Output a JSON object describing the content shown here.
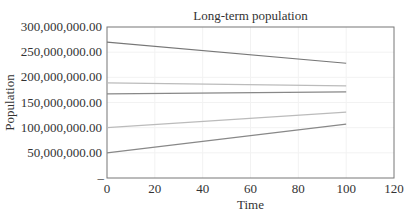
{
  "chart_data": {
    "type": "line",
    "title": "Long-term population",
    "xlabel": "Time",
    "ylabel": "Population",
    "xlim": [
      0,
      120
    ],
    "ylim": [
      0,
      300000000
    ],
    "x_ticks": [
      "0",
      "20",
      "40",
      "60",
      "80",
      "100",
      "120"
    ],
    "y_ticks": [
      "–",
      "50,000,000.00",
      "100,000,000.00",
      "150,000,000.00",
      "200,000,000.00",
      "250,000,000.00",
      "300,000,000.00"
    ],
    "grid": true,
    "legend": null,
    "x": [
      0,
      100
    ],
    "series": [
      {
        "name": "series-1",
        "color": "#777777",
        "values": [
          270000000,
          228000000
        ]
      },
      {
        "name": "series-2",
        "color": "#bbbbbb",
        "values": [
          189000000,
          183000000
        ]
      },
      {
        "name": "series-3",
        "color": "#888888",
        "values": [
          167000000,
          171000000
        ]
      },
      {
        "name": "series-4",
        "color": "#bbbbbb",
        "values": [
          100000000,
          131000000
        ]
      },
      {
        "name": "series-5",
        "color": "#888888",
        "values": [
          50000000,
          107000000
        ]
      }
    ]
  }
}
